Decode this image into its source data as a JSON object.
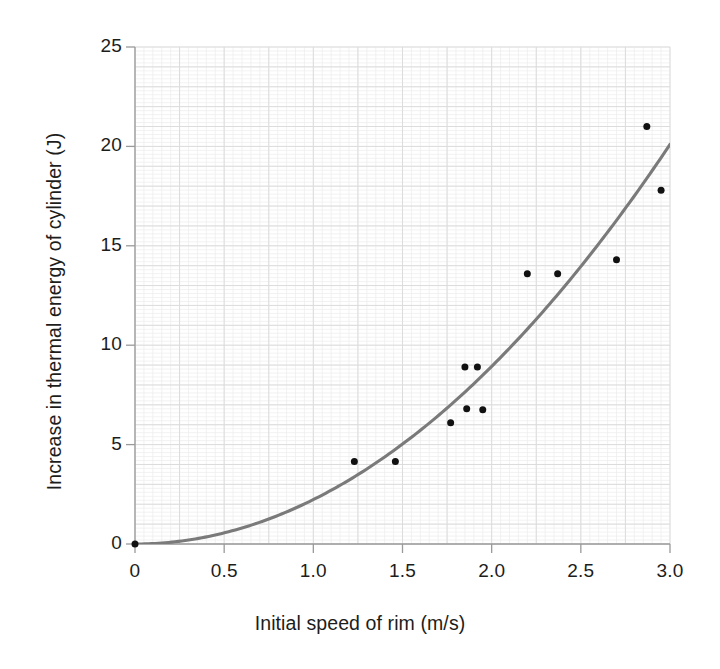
{
  "chart_data": {
    "type": "scatter",
    "title": "",
    "xlabel": "Initial speed of rim (m/s)",
    "ylabel": "Increase in thermal energy of cylinder (J)",
    "xlim": [
      0,
      3.0
    ],
    "ylim": [
      0,
      25
    ],
    "xticks": [
      0,
      0.5,
      1.0,
      1.5,
      2.0,
      2.5,
      3.0
    ],
    "xtick_labels": [
      "0",
      "0.5",
      "1.0",
      "1.5",
      "2.0",
      "2.5",
      "3.0"
    ],
    "yticks": [
      0,
      5,
      10,
      15,
      20,
      25
    ],
    "ytick_labels": [
      "0",
      "5",
      "10",
      "15",
      "20",
      "25"
    ],
    "grid": true,
    "grid_major_x_step": 0.25,
    "grid_major_y_step": 1,
    "grid_minor_x_step": 0.05,
    "grid_minor_y_step": 0.2,
    "legend": "none",
    "marker_color": "#111111",
    "marker_size": 7,
    "grid_color": "#dcdcdc",
    "grid_minor_color": "#ededed",
    "axis_color": "#9a9a9a",
    "series": [
      {
        "name": "Measured points",
        "type": "scatter",
        "points": [
          {
            "x": 0.0,
            "y": 0.0
          },
          {
            "x": 1.23,
            "y": 4.15
          },
          {
            "x": 1.46,
            "y": 4.15
          },
          {
            "x": 1.77,
            "y": 6.1
          },
          {
            "x": 1.86,
            "y": 6.8
          },
          {
            "x": 1.95,
            "y": 6.75
          },
          {
            "x": 1.85,
            "y": 8.9
          },
          {
            "x": 1.92,
            "y": 8.9
          },
          {
            "x": 2.2,
            "y": 13.6
          },
          {
            "x": 2.37,
            "y": 13.6
          },
          {
            "x": 2.7,
            "y": 14.3
          },
          {
            "x": 2.87,
            "y": 21.0
          },
          {
            "x": 2.95,
            "y": 17.8
          }
        ]
      },
      {
        "name": "Fitted quadratic curve",
        "type": "line",
        "color": "#7a7a7a",
        "equation": "y = 2.23 x^2",
        "x_start": 0.0,
        "x_end": 3.0,
        "y_start": 0.0,
        "y_end": 20.1
      }
    ]
  }
}
